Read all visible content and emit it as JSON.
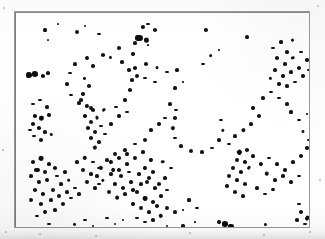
{
  "figure": {
    "title": "",
    "caption": "",
    "kind": "scanned dot-pattern micrograph",
    "frame": {
      "x": 14,
      "y": 11,
      "width": 296,
      "height": 217,
      "border_color": "#9a9a9a"
    },
    "background_color": "#ffffff",
    "page_color": "#fdfdfc",
    "dot_color": "#141414"
  },
  "chart_data": {
    "type": "scatter",
    "title": "",
    "xlabel": "",
    "ylabel": "",
    "grid": false,
    "legend": null,
    "xlim": [
      0,
      296
    ],
    "ylim": [
      0,
      217
    ],
    "axis_ticks": {
      "x": [],
      "y": []
    },
    "marker_color": "#141414",
    "marker_shape": "filled-irregular-dot",
    "point_count": 268,
    "points": [
      [
        30,
        18,
        2.0
      ],
      [
        33,
        28,
        1.6
      ],
      [
        43,
        12,
        1.4
      ],
      [
        128,
        15,
        3.2
      ],
      [
        133,
        12,
        2.0
      ],
      [
        140,
        18,
        2.6
      ],
      [
        124,
        26,
        4.6
      ],
      [
        132,
        28,
        3.4
      ],
      [
        120,
        31,
        2.4
      ],
      [
        62,
        20,
        2.8
      ],
      [
        70,
        14,
        1.6
      ],
      [
        84,
        22,
        2.0
      ],
      [
        191,
        18,
        3.2
      ],
      [
        232,
        25,
        2.4
      ],
      [
        278,
        28,
        2.0
      ],
      [
        300,
        30,
        2.2
      ],
      [
        312,
        33,
        1.8
      ],
      [
        104,
        36,
        2.6
      ],
      [
        118,
        42,
        2.2
      ],
      [
        133,
        33,
        1.8
      ],
      [
        88,
        43,
        2.8
      ],
      [
        72,
        46,
        2.6
      ],
      [
        60,
        52,
        2.4
      ],
      [
        55,
        61,
        2.2
      ],
      [
        52,
        72,
        2.4
      ],
      [
        56,
        83,
        2.2
      ],
      [
        64,
        91,
        2.4
      ],
      [
        76,
        96,
        2.6
      ],
      [
        89,
        98,
        2.4
      ],
      [
        101,
        95,
        2.2
      ],
      [
        110,
        88,
        2.4
      ],
      [
        115,
        78,
        2.6
      ],
      [
        117,
        68,
        2.4
      ],
      [
        114,
        58,
        2.2
      ],
      [
        107,
        50,
        2.4
      ],
      [
        96,
        45,
        2.0
      ],
      [
        14,
        63,
        3.6
      ],
      [
        20,
        62,
        4.4
      ],
      [
        28,
        64,
        3.0
      ],
      [
        33,
        61,
        2.4
      ],
      [
        120,
        56,
        2.6
      ],
      [
        131,
        52,
        2.8
      ],
      [
        142,
        56,
        2.2
      ],
      [
        152,
        60,
        2.0
      ],
      [
        162,
        58,
        2.4
      ],
      [
        122,
        64,
        2.6
      ],
      [
        130,
        66,
        2.2
      ],
      [
        140,
        70,
        2.0
      ],
      [
        78,
        54,
        2.2
      ],
      [
        70,
        66,
        2.0
      ],
      [
        74,
        74,
        2.6
      ],
      [
        68,
        82,
        2.2
      ],
      [
        18,
        92,
        2.0
      ],
      [
        25,
        88,
        2.2
      ],
      [
        32,
        95,
        2.4
      ],
      [
        20,
        104,
        3.0
      ],
      [
        27,
        106,
        3.4
      ],
      [
        34,
        103,
        2.2
      ],
      [
        18,
        112,
        2.6
      ],
      [
        24,
        116,
        3.2
      ],
      [
        30,
        120,
        2.4
      ],
      [
        19,
        124,
        2.2
      ],
      [
        26,
        128,
        2.6
      ],
      [
        36,
        122,
        1.8
      ],
      [
        15,
        118,
        2.0
      ],
      [
        66,
        88,
        2.4
      ],
      [
        72,
        94,
        3.0
      ],
      [
        78,
        98,
        2.6
      ],
      [
        70,
        104,
        3.2
      ],
      [
        76,
        110,
        2.8
      ],
      [
        82,
        106,
        2.4
      ],
      [
        73,
        116,
        3.0
      ],
      [
        80,
        120,
        2.6
      ],
      [
        86,
        114,
        2.2
      ],
      [
        76,
        126,
        2.8
      ],
      [
        84,
        130,
        2.4
      ],
      [
        90,
        122,
        2.0
      ],
      [
        80,
        136,
        2.6
      ],
      [
        104,
        104,
        2.2
      ],
      [
        112,
        100,
        2.0
      ],
      [
        96,
        112,
        2.4
      ],
      [
        155,
        92,
        2.4
      ],
      [
        161,
        98,
        2.2
      ],
      [
        160,
        106,
        2.6
      ],
      [
        158,
        116,
        2.4
      ],
      [
        160,
        126,
        2.2
      ],
      [
        166,
        134,
        2.4
      ],
      [
        176,
        139,
        2.6
      ],
      [
        187,
        140,
        2.4
      ],
      [
        197,
        136,
        2.2
      ],
      [
        204,
        128,
        2.4
      ],
      [
        208,
        118,
        2.2
      ],
      [
        206,
        108,
        2.0
      ],
      [
        130,
        128,
        2.6
      ],
      [
        120,
        132,
        2.2
      ],
      [
        110,
        138,
        2.4
      ],
      [
        100,
        142,
        2.6
      ],
      [
        92,
        148,
        2.4
      ],
      [
        86,
        156,
        2.6
      ],
      [
        82,
        164,
        2.4
      ],
      [
        84,
        172,
        2.2
      ],
      [
        136,
        118,
        2.4
      ],
      [
        144,
        112,
        2.2
      ],
      [
        150,
        106,
        2.0
      ],
      [
        18,
        150,
        2.6
      ],
      [
        26,
        146,
        3.0
      ],
      [
        34,
        152,
        2.4
      ],
      [
        22,
        158,
        3.4
      ],
      [
        30,
        160,
        2.8
      ],
      [
        40,
        156,
        2.6
      ],
      [
        16,
        164,
        2.4
      ],
      [
        24,
        170,
        3.0
      ],
      [
        32,
        168,
        2.6
      ],
      [
        42,
        164,
        2.2
      ],
      [
        50,
        160,
        2.4
      ],
      [
        20,
        178,
        2.8
      ],
      [
        28,
        182,
        3.2
      ],
      [
        38,
        178,
        2.6
      ],
      [
        46,
        172,
        2.4
      ],
      [
        54,
        168,
        2.2
      ],
      [
        16,
        188,
        2.6
      ],
      [
        26,
        192,
        3.0
      ],
      [
        36,
        188,
        2.4
      ],
      [
        44,
        184,
        2.8
      ],
      [
        52,
        180,
        2.4
      ],
      [
        60,
        176,
        2.2
      ],
      [
        30,
        200,
        2.6
      ],
      [
        40,
        198,
        2.4
      ],
      [
        22,
        204,
        2.0
      ],
      [
        48,
        192,
        2.6
      ],
      [
        56,
        186,
        2.2
      ],
      [
        64,
        182,
        2.4
      ],
      [
        62,
        150,
        2.4
      ],
      [
        70,
        146,
        2.6
      ],
      [
        78,
        150,
        2.2
      ],
      [
        68,
        158,
        2.8
      ],
      [
        76,
        162,
        2.4
      ],
      [
        84,
        156,
        2.2
      ],
      [
        72,
        170,
        2.6
      ],
      [
        80,
        176,
        2.4
      ],
      [
        88,
        168,
        2.2
      ],
      [
        96,
        162,
        2.4
      ],
      [
        104,
        158,
        2.6
      ],
      [
        112,
        152,
        2.4
      ],
      [
        96,
        150,
        3.0
      ],
      [
        104,
        146,
        2.6
      ],
      [
        112,
        142,
        2.4
      ],
      [
        98,
        158,
        2.8
      ],
      [
        106,
        164,
        2.6
      ],
      [
        114,
        160,
        2.2
      ],
      [
        100,
        172,
        3.0
      ],
      [
        108,
        176,
        2.6
      ],
      [
        116,
        170,
        2.4
      ],
      [
        94,
        180,
        2.6
      ],
      [
        102,
        186,
        2.8
      ],
      [
        110,
        182,
        2.4
      ],
      [
        118,
        178,
        2.2
      ],
      [
        126,
        172,
        2.4
      ],
      [
        134,
        166,
        2.6
      ],
      [
        120,
        146,
        2.8
      ],
      [
        128,
        140,
        2.4
      ],
      [
        136,
        148,
        2.6
      ],
      [
        130,
        156,
        3.0
      ],
      [
        138,
        160,
        2.6
      ],
      [
        124,
        162,
        2.4
      ],
      [
        132,
        170,
        2.8
      ],
      [
        140,
        176,
        2.4
      ],
      [
        122,
        180,
        2.6
      ],
      [
        130,
        186,
        3.0
      ],
      [
        138,
        190,
        2.6
      ],
      [
        146,
        184,
        2.4
      ],
      [
        126,
        196,
        2.8
      ],
      [
        134,
        200,
        2.4
      ],
      [
        142,
        194,
        2.6
      ],
      [
        118,
        192,
        2.2
      ],
      [
        148,
        150,
        2.4
      ],
      [
        156,
        156,
        2.2
      ],
      [
        150,
        166,
        2.4
      ],
      [
        144,
        172,
        2.6
      ],
      [
        152,
        178,
        2.2
      ],
      [
        152,
        196,
        2.8
      ],
      [
        160,
        200,
        2.4
      ],
      [
        146,
        204,
        2.6
      ],
      [
        138,
        208,
        2.4
      ],
      [
        130,
        210,
        2.2
      ],
      [
        122,
        206,
        2.0
      ],
      [
        238,
        96,
        2.2
      ],
      [
        244,
        104,
        2.6
      ],
      [
        236,
        112,
        2.4
      ],
      [
        228,
        118,
        2.8
      ],
      [
        220,
        124,
        2.4
      ],
      [
        214,
        132,
        2.2
      ],
      [
        248,
        86,
        2.4
      ],
      [
        256,
        80,
        2.2
      ],
      [
        264,
        86,
        2.0
      ],
      [
        272,
        92,
        2.4
      ],
      [
        225,
        140,
        3.4
      ],
      [
        232,
        138,
        2.6
      ],
      [
        222,
        148,
        2.8
      ],
      [
        230,
        150,
        3.2
      ],
      [
        238,
        144,
        2.4
      ],
      [
        218,
        156,
        2.6
      ],
      [
        226,
        160,
        3.0
      ],
      [
        234,
        156,
        2.4
      ],
      [
        214,
        164,
        2.8
      ],
      [
        222,
        168,
        2.4
      ],
      [
        230,
        172,
        2.6
      ],
      [
        212,
        174,
        2.2
      ],
      [
        220,
        180,
        2.8
      ],
      [
        228,
        184,
        2.4
      ],
      [
        246,
        152,
        2.4
      ],
      [
        254,
        146,
        2.2
      ],
      [
        262,
        152,
        2.4
      ],
      [
        270,
        158,
        2.2
      ],
      [
        278,
        150,
        2.4
      ],
      [
        286,
        144,
        2.6
      ],
      [
        292,
        136,
        2.2
      ],
      [
        252,
        162,
        2.6
      ],
      [
        260,
        168,
        2.4
      ],
      [
        268,
        164,
        2.2
      ],
      [
        276,
        170,
        2.4
      ],
      [
        284,
        164,
        2.2
      ],
      [
        242,
        176,
        2.4
      ],
      [
        250,
        182,
        2.2
      ],
      [
        258,
        178,
        2.4
      ],
      [
        174,
        188,
        2.0
      ],
      [
        182,
        196,
        2.2
      ],
      [
        168,
        198,
        1.8
      ],
      [
        276,
        100,
        2.0
      ],
      [
        284,
        108,
        2.2
      ],
      [
        292,
        102,
        1.8
      ],
      [
        288,
        120,
        2.2
      ],
      [
        294,
        128,
        2.0
      ],
      [
        258,
        36,
        2.2
      ],
      [
        266,
        30,
        2.0
      ],
      [
        272,
        40,
        2.4
      ],
      [
        262,
        46,
        2.6
      ],
      [
        270,
        52,
        2.2
      ],
      [
        278,
        46,
        2.4
      ],
      [
        286,
        40,
        2.0
      ],
      [
        292,
        48,
        2.2
      ],
      [
        284,
        56,
        2.6
      ],
      [
        276,
        60,
        2.4
      ],
      [
        268,
        64,
        2.2
      ],
      [
        260,
        58,
        2.4
      ],
      [
        256,
        66,
        2.0
      ],
      [
        264,
        72,
        2.2
      ],
      [
        272,
        74,
        2.4
      ],
      [
        280,
        70,
        2.0
      ],
      [
        288,
        64,
        2.2
      ],
      [
        294,
        58,
        2.0
      ],
      [
        296,
        68,
        2.2
      ],
      [
        196,
        44,
        2.0
      ],
      [
        204,
        38,
        1.8
      ],
      [
        188,
        52,
        2.2
      ],
      [
        160,
        76,
        2.0
      ],
      [
        168,
        70,
        1.8
      ],
      [
        34,
        212,
        2.0
      ],
      [
        44,
        216,
        1.8
      ],
      [
        60,
        212,
        2.2
      ],
      [
        70,
        208,
        2.0
      ],
      [
        78,
        214,
        1.8
      ],
      [
        210,
        212,
        4.2
      ],
      [
        216,
        214,
        3.4
      ],
      [
        204,
        210,
        2.2
      ],
      [
        286,
        200,
        2.6
      ],
      [
        292,
        206,
        3.0
      ],
      [
        282,
        208,
        2.4
      ],
      [
        290,
        212,
        2.2
      ],
      [
        284,
        192,
        2.0
      ],
      [
        168,
        214,
        2.0
      ],
      [
        180,
        210,
        1.8
      ],
      [
        152,
        214,
        1.6
      ],
      [
        250,
        212,
        1.8
      ],
      [
        238,
        216,
        1.6
      ],
      [
        92,
        206,
        2.0
      ],
      [
        100,
        212,
        1.8
      ],
      [
        108,
        208,
        1.6
      ]
    ]
  },
  "page_specks": [
    [
      6,
      232,
      1.4
    ],
    [
      40,
      234,
      1.2
    ],
    [
      96,
      236,
      1.3
    ],
    [
      190,
      233,
      1.2
    ],
    [
      264,
      235,
      1.3
    ],
    [
      310,
      232,
      1.2
    ],
    [
      4,
      8,
      1.2
    ],
    [
      318,
      6,
      1.1
    ],
    [
      320,
      180,
      1.2
    ],
    [
      3,
      150,
      1.1
    ]
  ]
}
